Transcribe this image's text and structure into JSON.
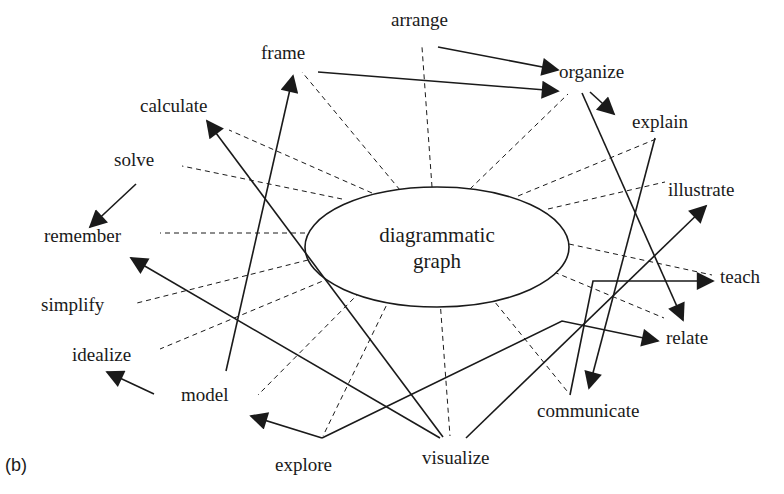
{
  "panel_label": "(b)",
  "center_node": {
    "line1": "diagrammatic",
    "line2": "graph"
  },
  "nodes": {
    "arrange": "arrange",
    "frame": "frame",
    "organize": "organize",
    "calculate": "calculate",
    "explain": "explain",
    "solve": "solve",
    "illustrate": "illustrate",
    "remember": "remember",
    "teach": "teach",
    "simplify": "simplify",
    "relate": "relate",
    "idealize": "idealize",
    "model": "model",
    "communicate": "communicate",
    "explore": "explore",
    "visualize": "visualize"
  },
  "dashed_links": [
    "frame",
    "arrange",
    "organize",
    "explain",
    "illustrate",
    "teach",
    "relate",
    "communicate",
    "visualize",
    "explore",
    "model",
    "idealize",
    "simplify",
    "remember",
    "solve",
    "calculate"
  ],
  "arrows": [
    {
      "from": "arrange",
      "to": "organize"
    },
    {
      "from": "frame",
      "to": "organize"
    },
    {
      "from": "organize",
      "to": "explain"
    },
    {
      "from": "organize",
      "to": "relate"
    },
    {
      "from": "explain",
      "to": "communicate"
    },
    {
      "from": "communicate",
      "to": "teach"
    },
    {
      "from": "solve",
      "to": "remember"
    },
    {
      "from": "model",
      "to": "frame"
    },
    {
      "from": "visualize",
      "to": "calculate"
    },
    {
      "from": "visualize",
      "to": "remember"
    },
    {
      "from": "visualize",
      "to": "illustrate"
    },
    {
      "from": "explore",
      "to": "model"
    },
    {
      "from": "explore",
      "to": "relate"
    },
    {
      "from": "idealize",
      "to": "idealize-outward"
    }
  ],
  "colors": {
    "ink": "#1a1a1a",
    "background": "#ffffff"
  }
}
